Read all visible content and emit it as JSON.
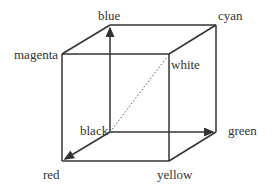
{
  "diagram": {
    "vertices": {
      "blue": "blue",
      "cyan": "cyan",
      "magenta": "magenta",
      "white": "white",
      "black": "black",
      "green": "green",
      "red": "red",
      "yellow": "yellow"
    },
    "line_color": "#333333",
    "diagonal": "black-to-white (dotted)"
  }
}
